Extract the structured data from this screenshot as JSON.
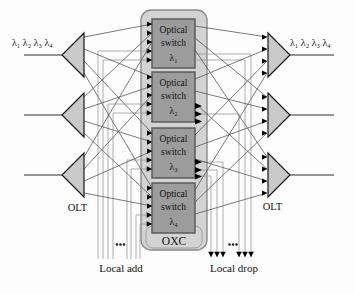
{
  "diagram": {
    "left_wavelengths": "λ₁ λ₂ λ₃ λ₄",
    "right_wavelengths": "λ₁ λ₂ λ₃ λ₄",
    "olt_left": "OLT",
    "olt_right": "OLT",
    "oxc_label": "OXC",
    "local_add_label": "Local add",
    "local_drop_label": "Local drop",
    "switches": [
      {
        "line1": "Optical",
        "line2": "switch",
        "line3": "λ₁"
      },
      {
        "line1": "Optical",
        "line2": "switch",
        "line3": "λ₂"
      },
      {
        "line1": "Optical",
        "line2": "switch",
        "line3": "λ₃"
      },
      {
        "line1": "Optical",
        "line2": "switch",
        "line3": "λ₄"
      }
    ],
    "colors": {
      "oxc_fill": "#d3d3d3",
      "oxc_border": "#8c8c8c",
      "inner_border": "#9e9e9e",
      "switch_fill": "#9c9c9c",
      "switch_border": "#565656",
      "tri_fill": "#c9c9c9",
      "tri_border": "#1a1a1a",
      "mesh": "#4f4f4f",
      "routing": "#9a9a9a",
      "io": "#2e2e2e",
      "arrow": "#000000",
      "text": "#111111"
    }
  }
}
